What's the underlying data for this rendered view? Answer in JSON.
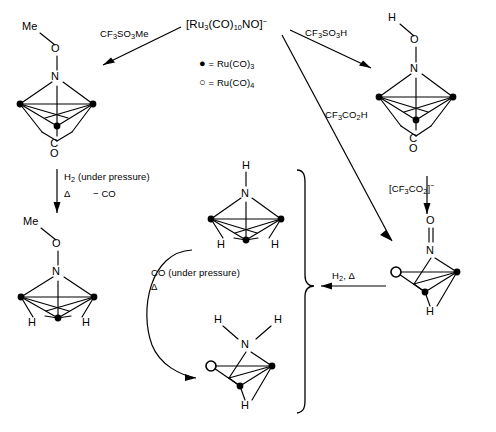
{
  "scheme": {
    "title": "Reaction scheme of [Ru3(CO)10NO]- cluster transformations",
    "legend": {
      "filled_symbol": "●",
      "filled_label": "= Ru(CO)",
      "filled_sub": "3",
      "open_symbol": "○",
      "open_label": "= Ru(CO)",
      "open_sub": "4"
    },
    "reagents": {
      "top_center": "[Ru",
      "top_center_sub1": "3",
      "top_center_mid": "(CO)",
      "top_center_sub2": "10",
      "top_center_end": "NO]",
      "top_center_charge": "−",
      "left_arrow": "CF",
      "left_arrow_sub": "3",
      "left_arrow_rest": "SO",
      "left_arrow_sub2": "3",
      "left_arrow_end": "Me",
      "right_arrow": "CF",
      "right_arrow_sub": "3",
      "right_arrow_rest": "SO",
      "right_arrow_sub2": "3",
      "right_arrow_end": "H",
      "diag_arrow": "CF",
      "diag_arrow_sub": "3",
      "diag_arrow_rest": "CO",
      "diag_arrow_sub2": "2",
      "diag_arrow_end": "H",
      "right_down": "[CF",
      "right_down_sub": "3",
      "right_down_rest": "CO",
      "right_down_sub2": "2",
      "right_down_end": "]",
      "right_down_charge": "−",
      "left_down_line1": "H",
      "left_down_line1_sub": "2",
      "left_down_line1_rest": " (under pressure)",
      "left_down_line2": "Δ",
      "left_down_line3": "− CO",
      "curved_line1": "CO (under pressure)",
      "curved_line2": "Δ",
      "right_in": "H",
      "right_in_sub": "2",
      "right_in_rest": ", Δ"
    },
    "structures": {
      "top_left": {
        "name": "methoxyimido-tricarbonyl-cluster",
        "cap_top": "Me",
        "oxygen": "O",
        "nitrogen": "N",
        "bottom": "CO"
      },
      "top_right": {
        "name": "hydroxyimido-cluster",
        "cap_top": "H",
        "oxygen": "O",
        "nitrogen": "N",
        "bottom": "CO"
      },
      "bottom_left": {
        "name": "methoxyimido-dihydrido-cluster",
        "cap_top": "Me",
        "oxygen": "O",
        "nitrogen": "N",
        "h_left": "H",
        "h_right": "H"
      },
      "center": {
        "name": "imido-dihydrido-cluster",
        "cap_top": "H",
        "nitrogen": "N",
        "h_left": "H",
        "h_right": "H"
      },
      "bottom_center": {
        "name": "amido-hydrido-cluster",
        "h_left": "H",
        "h_right": "H",
        "nitrogen": "N",
        "h_bottom": "H"
      },
      "bottom_right": {
        "name": "nitrosyl-hydrido-cluster",
        "oxygen": "O",
        "nitrogen": "N",
        "h_bottom": "H"
      }
    }
  }
}
